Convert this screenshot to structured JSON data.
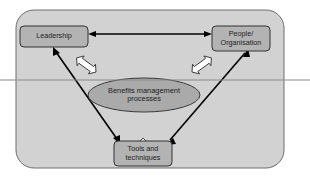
{
  "diagram": {
    "container": {
      "name": "outer-boundary",
      "shape": "rounded-rectangle",
      "fill": "#d2d2d2",
      "stroke": "#6e6e6e"
    },
    "canvas": {
      "background": "#ffffff",
      "width": 310,
      "height": 181
    },
    "scan_line": {
      "name": "scan-artifact-line",
      "color": "#8a8a8a",
      "y": 80
    },
    "nodes": [
      {
        "id": "leadership",
        "label": "Leadership",
        "shape": "rounded-rectangle",
        "fill": "#b3b3b3",
        "stroke": "#333333"
      },
      {
        "id": "people-organisation",
        "label": "People/\nOrganisation",
        "shape": "rounded-rectangle",
        "fill": "#b3b3b3",
        "stroke": "#333333"
      },
      {
        "id": "tools-techniques",
        "label": "Tools and\ntechniques",
        "shape": "rounded-rectangle",
        "fill": "#b3b3b3",
        "stroke": "#333333"
      },
      {
        "id": "benefits-management-processes",
        "label": "Benefits management\nprocesses",
        "shape": "ellipse",
        "fill": "#aaaaaa",
        "stroke": "#3a3a3a"
      }
    ],
    "connectors": [
      {
        "id": "leadership-people",
        "from": "leadership",
        "to": "people-organisation",
        "style": "thin-line",
        "heads": "double",
        "color": "#000000"
      },
      {
        "id": "leadership-tools",
        "from": "leadership",
        "to": "tools-techniques",
        "style": "thin-line",
        "heads": "double",
        "color": "#000000"
      },
      {
        "id": "tools-people",
        "from": "tools-techniques",
        "to": "people-organisation",
        "style": "thin-line",
        "heads": "double",
        "color": "#000000"
      },
      {
        "id": "processes-leadership",
        "from": "benefits-management-processes",
        "to": "leadership",
        "style": "block-arrow",
        "heads": "double",
        "color": "#ffffff"
      },
      {
        "id": "processes-people",
        "from": "benefits-management-processes",
        "to": "people-organisation",
        "style": "block-arrow",
        "heads": "double",
        "color": "#ffffff"
      },
      {
        "id": "processes-tools",
        "from": "benefits-management-processes",
        "to": "tools-techniques",
        "style": "block-arrow",
        "heads": "double",
        "color": "#ffffff"
      }
    ]
  }
}
